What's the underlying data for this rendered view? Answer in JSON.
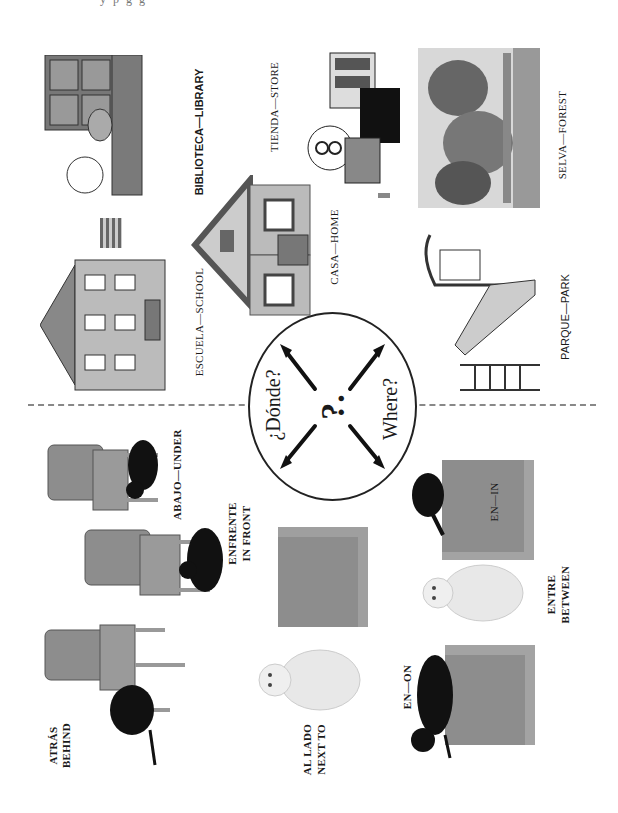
{
  "page": {
    "top_cut_text": "y    p    g g",
    "divider": "dashed-line"
  },
  "center": {
    "question_es": "¿Dónde?",
    "question_en": "Where?",
    "symbol": "?."
  },
  "places": [
    {
      "label": "BIBLIOTECA—LIBRARY",
      "icon": "library-illustration"
    },
    {
      "label": "TIENDA—STORE",
      "icon": "store-illustration"
    },
    {
      "label": "SELVA—FOREST",
      "icon": "forest-illustration"
    },
    {
      "label": "ESCUELA—SCHOOL",
      "icon": "school-illustration"
    },
    {
      "label": "CASA—HOME",
      "icon": "house-illustration"
    },
    {
      "label": "PARQUE—PARK",
      "icon": "playground-illustration"
    }
  ],
  "prepositions": [
    {
      "es": "ABAJO—UNDER",
      "en": "",
      "icon": "cat-under-chair"
    },
    {
      "es": "ENFRENTE",
      "en": "IN FRONT",
      "icon": "cat-in-front-of-chair"
    },
    {
      "es": "ATRÁS",
      "en": "BEHIND",
      "icon": "cat-behind-chair"
    },
    {
      "es": "AL LADO",
      "en": "NEXT TO",
      "icon": "cat-next-to-box"
    },
    {
      "es": "EN—ON",
      "en": "",
      "icon": "cat-on-box"
    },
    {
      "es": "ENTRE",
      "en": "BETWEEN",
      "icon": "cat-between-boxes"
    },
    {
      "es": "EN—IN",
      "en": "",
      "icon": "cat-in-box"
    }
  ],
  "colors": {
    "ink": "#1a1a1a",
    "gray_fill": "#8d8d8d",
    "light_gray": "#c8c8c8",
    "cat_black": "#111111",
    "cat_white": "#e8e8e8"
  }
}
